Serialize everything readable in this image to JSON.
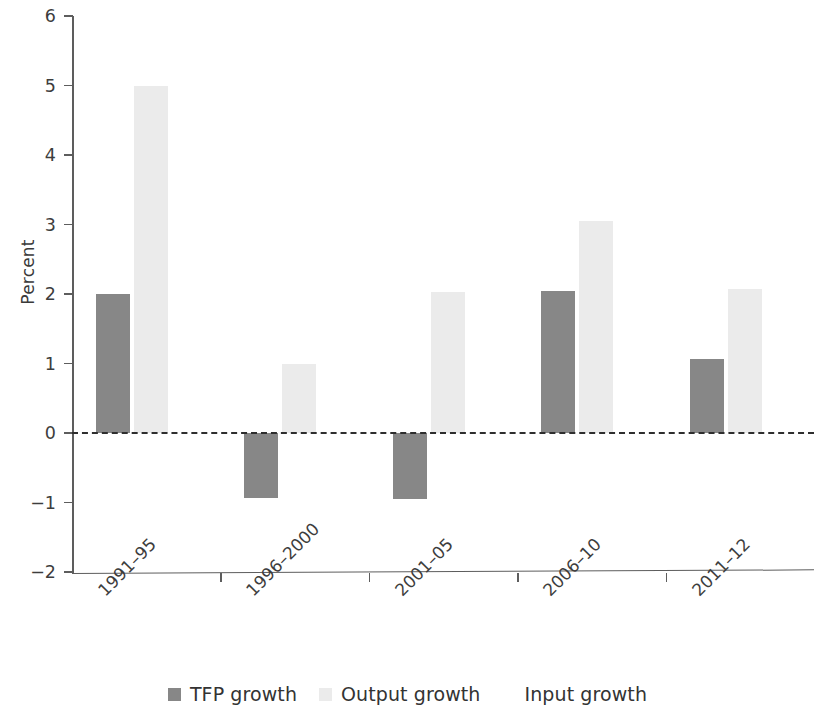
{
  "chart_data": {
    "type": "bar",
    "title": "",
    "subtitle": "",
    "xlabel": "",
    "ylabel": "Percent",
    "categories": [
      "1991–95",
      "1996–2000",
      "2001–05",
      "2006–10",
      "2011–12"
    ],
    "series": [
      {
        "name": "TFP growth",
        "color": "#878787",
        "values": [
          2.0,
          -0.93,
          -0.95,
          2.05,
          1.07
        ]
      },
      {
        "name": "Output growth",
        "color": "#ebebeb",
        "values": [
          5.0,
          1.0,
          2.03,
          3.05,
          2.07
        ]
      },
      {
        "name": "Input growth",
        "color": "#fdfdfd",
        "values": [
          0.0,
          0.0,
          0.0,
          0.0,
          0.0
        ]
      }
    ],
    "ylim": [
      -2,
      6
    ],
    "yticks": [
      6,
      5,
      4,
      3,
      2,
      1,
      0,
      -1,
      -2
    ],
    "ytick_labels": [
      "6",
      "5",
      "4",
      "3",
      "2",
      "1",
      "0",
      "−1",
      "−2"
    ],
    "grid": false,
    "zero_line": true,
    "zero_line_style": "dashed",
    "legend_position": "bottom",
    "xtick_label_rotation": -45
  },
  "legend": {
    "items": [
      {
        "label": "TFP growth"
      },
      {
        "label": "Output growth"
      },
      {
        "label": "Input growth"
      }
    ]
  },
  "axes": {
    "y_title": "Percent"
  }
}
